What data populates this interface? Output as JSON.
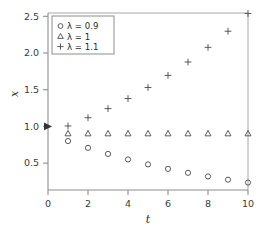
{
  "chart_data": {
    "type": "scatter",
    "title": "",
    "xlabel": "t",
    "ylabel": "x",
    "xlim": [
      0,
      10
    ],
    "ylim": [
      0.25,
      2.6
    ],
    "xticks": [
      0,
      2,
      4,
      6,
      8,
      10
    ],
    "xticklabels": [
      "0",
      "2",
      "4",
      "6",
      "8",
      "10"
    ],
    "yticks": [
      0.5,
      1.0,
      1.5,
      2.0,
      2.5
    ],
    "yticklabels": [
      "0.5",
      "1.0",
      "1.5",
      "2.0",
      "2.5"
    ],
    "grid": false,
    "legend_position": "upper-left",
    "x": [
      1,
      2,
      3,
      4,
      5,
      6,
      7,
      8,
      9,
      10
    ],
    "series": [
      {
        "name": "λ = 0.9",
        "marker": "circle",
        "values": [
          0.9,
          0.81,
          0.729,
          0.656,
          0.59,
          0.531,
          0.478,
          0.43,
          0.387,
          0.349
        ]
      },
      {
        "name": "λ = 1",
        "marker": "triangle",
        "values": [
          1.0,
          1.0,
          1.0,
          1.0,
          1.0,
          1.0,
          1.0,
          1.0,
          1.0,
          1.0
        ]
      },
      {
        "name": "λ = 1.1",
        "marker": "plus",
        "values": [
          1.1,
          1.21,
          1.331,
          1.464,
          1.611,
          1.772,
          1.949,
          2.144,
          2.358,
          2.594
        ]
      }
    ],
    "annotations": [
      {
        "name": "y-axis-arrow-marker",
        "x": 0,
        "y": 1.0,
        "symbol": "right-arrow"
      }
    ]
  },
  "axes": {
    "x_title": "t",
    "y_title": "x"
  },
  "legend": {
    "entries": [
      {
        "symbol": "○",
        "label": "λ = 0.9"
      },
      {
        "symbol": "△",
        "label": "λ = 1"
      },
      {
        "symbol": "+",
        "label": "λ = 1.1"
      }
    ]
  }
}
